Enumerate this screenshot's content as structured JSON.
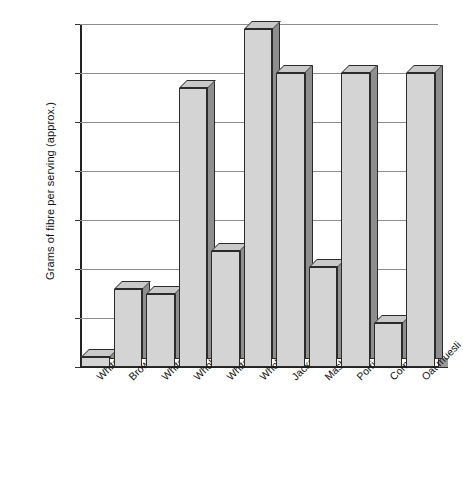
{
  "chart_data": {
    "type": "bar",
    "title": "",
    "xlabel": "",
    "ylabel": "Grams of fibre per serving (approx.)",
    "ylim": [
      0,
      3.5
    ],
    "yticks": [
      0,
      0.5,
      1,
      1.5,
      2,
      2.5,
      3,
      3.5
    ],
    "ytick_labels": [
      "0",
      "0.5",
      "1",
      "1.5",
      "2",
      "2.5",
      "3",
      "3.5"
    ],
    "grid": true,
    "legend": "none",
    "style": "3d-bar",
    "categories": [
      "White rice",
      "Brown rice",
      "White bread",
      "Wholemeal bread",
      "White pasta",
      "Wholemeal pasta",
      "Jacket potato",
      "Mashed potato",
      "Porridge",
      "Cornflakes",
      "Oat muesli"
    ],
    "values": [
      0.1,
      0.8,
      0.75,
      2.85,
      1.18,
      3.45,
      3.0,
      1.02,
      3.0,
      0.45,
      3.0
    ],
    "colors": {
      "bar_face": "#d4d4d4",
      "bar_side": "#8e8e8e",
      "bar_top": "#c9c9c9",
      "bar_outline": "#2b2b2b",
      "gridline": "#8d8d8d",
      "axis": "#222222",
      "background": "#ffffff",
      "text": "#111111"
    }
  }
}
